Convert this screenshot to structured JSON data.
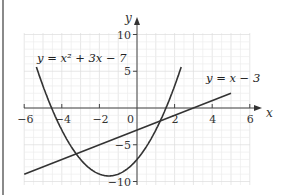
{
  "chart_data": {
    "type": "line",
    "title": "",
    "xlabel": "x",
    "ylabel": "y",
    "xlim": [
      -6,
      6
    ],
    "ylim": [
      -10,
      10
    ],
    "grid": true,
    "x_ticks": [
      "-6",
      "-4",
      "-2",
      "0",
      "2",
      "4",
      "6"
    ],
    "y_ticks": [
      "10",
      "5",
      "-5",
      "-10"
    ],
    "series": [
      {
        "name": "y = x² + 3x − 7",
        "label": "y = x² + 3x − 7",
        "type": "curve",
        "x": [
          -5.3,
          -5,
          -4,
          -3,
          -2,
          -1.5,
          -1,
          0,
          1,
          1.5,
          2,
          2.3
        ],
        "values": [
          5.19,
          3,
          -3,
          -7,
          -9,
          -9.25,
          -9,
          -7,
          -3,
          -0.25,
          3,
          5.19
        ],
        "color": "#333333"
      },
      {
        "name": "y = x − 3",
        "label": "y = x − 3",
        "type": "line",
        "x": [
          -6,
          5
        ],
        "values": [
          -9,
          2
        ],
        "color": "#333333"
      }
    ],
    "intersections": [
      [
        -4,
        -7
      ],
      [
        1,
        -2
      ]
    ],
    "legend_position": "inline labels"
  },
  "labels": {
    "x_axis": "x",
    "y_axis": "y",
    "curve_eq": "y = x² + 3x − 7",
    "line_eq": "y = x − 3",
    "tick_x": [
      "−6",
      "−4",
      "−2",
      "0",
      "2",
      "4",
      "6"
    ],
    "tick_y": [
      "10",
      "5",
      "−5",
      "−10"
    ]
  }
}
